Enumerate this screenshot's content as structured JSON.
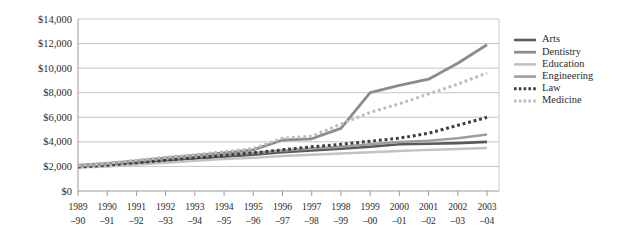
{
  "chart_data": {
    "type": "line",
    "title": "",
    "xlabel": "",
    "ylabel": "",
    "ylim": [
      0,
      14000
    ],
    "ytick_values": [
      0,
      2000,
      4000,
      6000,
      8000,
      10000,
      12000,
      14000
    ],
    "ytick_labels": [
      "$0",
      "$2,000",
      "$4,000",
      "$6,000",
      "$8,000",
      "$10,000",
      "$12,000",
      "$14,000"
    ],
    "grid": true,
    "legend_position": "right",
    "categories": [
      "1989–90",
      "1990–91",
      "1991–92",
      "1992–93",
      "1993–94",
      "1994–95",
      "1995–96",
      "1996–97",
      "1997–98",
      "1998–99",
      "1999–00",
      "2000–01",
      "2001–02",
      "2002–03",
      "2003–04"
    ],
    "categories_top": [
      "1989",
      "1990",
      "1991",
      "1992",
      "1993",
      "1994",
      "1995",
      "1996",
      "1997",
      "1998",
      "1999",
      "2000",
      "2001",
      "2002",
      "2003"
    ],
    "categories_bottom": [
      "–90",
      "–91",
      "–92",
      "–93",
      "–94",
      "–95",
      "–96",
      "–97",
      "–98",
      "–99",
      "–00",
      "–01",
      "–02",
      "–03",
      "–04"
    ],
    "series": [
      {
        "name": "Arts",
        "color": "#5a5a5a",
        "width": 2.6,
        "dash": "none",
        "values": [
          2000,
          2150,
          2300,
          2500,
          2650,
          2800,
          2950,
          3150,
          3300,
          3450,
          3600,
          3800,
          3850,
          3900,
          4000
        ]
      },
      {
        "name": "Dentistry",
        "color": "#8c8c8c",
        "width": 2.8,
        "dash": "none",
        "values": [
          2100,
          2250,
          2450,
          2700,
          2900,
          3100,
          3350,
          4150,
          4250,
          5100,
          8000,
          8600,
          9100,
          10400,
          11900
        ]
      },
      {
        "name": "Education",
        "color": "#c2c2c2",
        "width": 2.4,
        "dash": "none",
        "values": [
          1900,
          2000,
          2150,
          2300,
          2450,
          2600,
          2700,
          2850,
          2950,
          3050,
          3150,
          3250,
          3350,
          3420,
          3500
        ]
      },
      {
        "name": "Engineering",
        "color": "#9e9e9e",
        "width": 2.5,
        "dash": "none",
        "values": [
          2050,
          2200,
          2400,
          2600,
          2780,
          2950,
          3100,
          3300,
          3450,
          3600,
          3800,
          3980,
          4100,
          4300,
          4600
        ]
      },
      {
        "name": "Law",
        "color": "#3d3d3d",
        "width": 3.0,
        "dash": "dotted",
        "values": [
          1950,
          2100,
          2300,
          2500,
          2700,
          2900,
          3100,
          3350,
          3600,
          3800,
          4050,
          4300,
          4700,
          5350,
          6000
        ]
      },
      {
        "name": "Medicine",
        "color": "#bdbdbd",
        "width": 3.0,
        "dash": "dotted",
        "values": [
          2050,
          2250,
          2500,
          2750,
          2950,
          3200,
          3450,
          4300,
          4450,
          5450,
          6400,
          7100,
          7900,
          8700,
          9600
        ]
      }
    ]
  },
  "legend": {
    "items": [
      {
        "label": "Arts"
      },
      {
        "label": "Dentistry"
      },
      {
        "label": "Education"
      },
      {
        "label": "Engineering"
      },
      {
        "label": "Law"
      },
      {
        "label": "Medicine"
      }
    ]
  }
}
